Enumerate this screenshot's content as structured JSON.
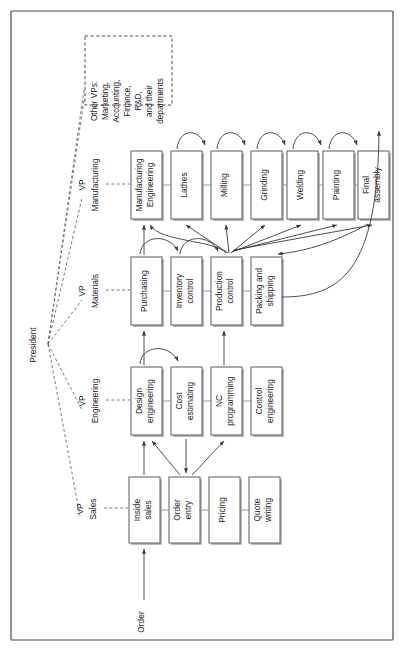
{
  "diagram": {
    "orientation": "rotated-90-ccw",
    "root": {
      "label": "President"
    },
    "other_vps": {
      "label": "Other VPs:\nMarketing,\nAccounting,\nFinance,\nR&D,\nand their\ndepartments",
      "lines": [
        "Other VPs:",
        "Marketing,",
        "Accounting,",
        "Finance,",
        "R&D,",
        "and their",
        "departments"
      ]
    },
    "entry": {
      "label": "Order"
    },
    "divisions": [
      {
        "id": "manufacturing",
        "vp_label_lines": [
          "VP",
          "Manufacturing"
        ],
        "departments": [
          {
            "id": "manufacturing-engineering",
            "lines": [
              "Manufacturing",
              "Engineering"
            ]
          },
          {
            "id": "lathes",
            "lines": [
              "Lathes"
            ]
          },
          {
            "id": "milling",
            "lines": [
              "Milling"
            ]
          },
          {
            "id": "grinding",
            "lines": [
              "Grinding"
            ]
          },
          {
            "id": "welding",
            "lines": [
              "Welding"
            ]
          },
          {
            "id": "painting",
            "lines": [
              "Painting"
            ]
          },
          {
            "id": "final-assembly",
            "lines": [
              "Final",
              "assembly"
            ]
          }
        ]
      },
      {
        "id": "materials",
        "vp_label_lines": [
          "VP",
          "Materials"
        ],
        "departments": [
          {
            "id": "purchasing",
            "lines": [
              "Purchasing"
            ]
          },
          {
            "id": "inventory-control",
            "lines": [
              "Inventory",
              "control"
            ]
          },
          {
            "id": "production-control",
            "lines": [
              "Production",
              "control"
            ]
          },
          {
            "id": "packing-and-shipping",
            "lines": [
              "Packing and",
              "shipping"
            ]
          }
        ]
      },
      {
        "id": "engineering",
        "vp_label_lines": [
          "VP",
          "Engineering"
        ],
        "departments": [
          {
            "id": "design-engineering",
            "lines": [
              "Design",
              "engineering"
            ]
          },
          {
            "id": "cost-estimating",
            "lines": [
              "Cost",
              "estimating"
            ]
          },
          {
            "id": "nc-programming",
            "lines": [
              "NC",
              "programming"
            ]
          },
          {
            "id": "control-engineering",
            "lines": [
              "Control",
              "engineering"
            ]
          }
        ]
      },
      {
        "id": "sales",
        "vp_label_lines": [
          "VP",
          "Sales"
        ],
        "departments": [
          {
            "id": "inside-sales",
            "lines": [
              "Inside",
              "sales"
            ]
          },
          {
            "id": "order-entry",
            "lines": [
              "Order",
              "entry"
            ]
          },
          {
            "id": "pricing",
            "lines": [
              "Pricing"
            ]
          },
          {
            "id": "quote-writing",
            "lines": [
              "Quote",
              "writing"
            ]
          }
        ]
      }
    ],
    "colors": {
      "frame": "#4a4a4a",
      "box_stroke": "#5a5a5a",
      "box_fill": "#ffffff",
      "shadow": "#b8b8b8",
      "flow": "#3a3a3a",
      "dashed": "#6a6a6a",
      "text": "#1a1a1a"
    }
  }
}
